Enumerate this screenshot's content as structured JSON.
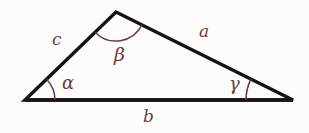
{
  "figure": {
    "kind": "geometry-diagram",
    "background_color": "#fdfcfa",
    "stroke_color": "#151210",
    "label_color": "#6e3b3b",
    "vertices": {
      "left": {
        "x": 25,
        "y": 100
      },
      "apex": {
        "x": 116,
        "y": 12
      },
      "right": {
        "x": 293,
        "y": 100
      }
    },
    "sides": [
      {
        "name": "a",
        "label": "a",
        "from": "apex",
        "to": "right",
        "label_x": 199,
        "label_y": 23
      },
      {
        "name": "b",
        "label": "b",
        "from": "left",
        "to": "right",
        "label_x": 143,
        "label_y": 108
      },
      {
        "name": "c",
        "label": "c",
        "from": "left",
        "to": "apex",
        "label_x": 52,
        "label_y": 31
      }
    ],
    "angles": [
      {
        "name": "alpha",
        "label": "α",
        "at": "left",
        "arc_radius": 30,
        "label_x": 62,
        "label_y": 74
      },
      {
        "name": "beta",
        "label": "β",
        "at": "apex",
        "arc_radius": 29,
        "label_x": 114,
        "label_y": 45
      },
      {
        "name": "gamma",
        "label": "γ",
        "at": "right",
        "arc_radius": 47,
        "label_x": 229,
        "label_y": 75
      }
    ]
  }
}
